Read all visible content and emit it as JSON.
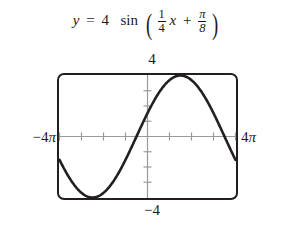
{
  "equation": {
    "lhs": "y",
    "equals": "=",
    "amplitude": "4",
    "function_name": "sin",
    "open_paren": "(",
    "coefficient_numerator": "1",
    "coefficient_denominator": "4",
    "variable": "x",
    "plus": "+",
    "phase_numerator": "π",
    "phase_denominator": "8",
    "close_paren": ")",
    "plain_text": "y = 4 sin(1/4 x + π/8)"
  },
  "labels": {
    "y_max": "4",
    "y_min": "−4",
    "x_min_number": "−4",
    "x_min_symbol": "π",
    "x_max_number": "4",
    "x_max_symbol": "π"
  },
  "colors": {
    "curve": "#231f20",
    "frame": "#231f20",
    "axis": "#9a9a9a",
    "background": "#ffffff",
    "text": "#1a1a1a"
  },
  "chart_data": {
    "type": "line",
    "xlabel": "",
    "ylabel": "",
    "grid": false,
    "legend": "none",
    "axis_style": "calculator-viewing-window",
    "xlim": [
      -12.566370614,
      12.566370614
    ],
    "ylim": [
      -4,
      4
    ],
    "xlim_labels": [
      "−4π",
      "4π"
    ],
    "ylim_labels": [
      "−4",
      "4"
    ],
    "x_tick_spacing": 3.14159265,
    "x_tick_spacing_label": "π",
    "y_tick_spacing": 1,
    "n_x_ticks_each_side": 4,
    "n_y_ticks_each_side": 4,
    "equation_params": {
      "amplitude": 4,
      "b": 0.25,
      "phase_shift_c": 0.392699,
      "period": 25.13274123,
      "period_label": "8π",
      "horizontal_shift": -1.570796,
      "horizontal_shift_label": "−π/2"
    },
    "key_points": [
      {
        "label": "left endpoint",
        "x": -12.566,
        "y": -2.828
      },
      {
        "label": "minimum",
        "x": -7.854,
        "y": -4
      },
      {
        "label": "zero ascending",
        "x": -1.571,
        "y": 0
      },
      {
        "label": "maximum",
        "x": 4.712,
        "y": 4
      },
      {
        "label": "zero descending",
        "x": 10.996,
        "y": 0
      },
      {
        "label": "right endpoint",
        "x": 12.566,
        "y": -1.531
      }
    ],
    "x": [
      -12.566,
      -11.781,
      -10.996,
      -10.21,
      -9.425,
      -8.639,
      -7.854,
      -7.069,
      -6.283,
      -5.498,
      -4.712,
      -3.927,
      -3.142,
      -2.356,
      -1.571,
      -0.785,
      0.0,
      0.785,
      1.571,
      2.356,
      3.142,
      3.927,
      4.712,
      5.498,
      6.283,
      7.069,
      7.854,
      8.639,
      9.425,
      10.21,
      10.996,
      11.781,
      12.566
    ],
    "y": [
      -2.828,
      -3.488,
      -3.864,
      -3.975,
      -3.804,
      -3.392,
      -4.0,
      -3.945,
      -3.696,
      -3.266,
      -2.828,
      -2.165,
      -1.531,
      -0.78,
      0.0,
      0.78,
      1.531,
      2.165,
      2.828,
      3.266,
      3.696,
      3.945,
      4.0,
      3.945,
      3.696,
      3.266,
      2.828,
      2.165,
      1.531,
      0.78,
      0.0,
      -0.78,
      -1.531
    ]
  }
}
